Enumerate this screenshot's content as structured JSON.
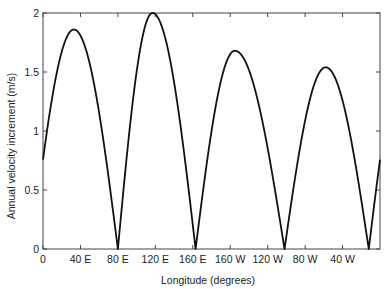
{
  "chart_data": {
    "type": "line",
    "title": "",
    "xlabel": "Longitude (degrees)",
    "ylabel": "Annual velocity increment (m/s)",
    "xlim": [
      0,
      360
    ],
    "ylim": [
      0,
      2
    ],
    "grid": false,
    "legend": null,
    "x_ticks": [
      {
        "value": 0,
        "label": "0"
      },
      {
        "value": 40,
        "label": "40 E"
      },
      {
        "value": 80,
        "label": "80 E"
      },
      {
        "value": 120,
        "label": "120 E"
      },
      {
        "value": 160,
        "label": "160 E"
      },
      {
        "value": 200,
        "label": "160 W"
      },
      {
        "value": 240,
        "label": "120 W"
      },
      {
        "value": 280,
        "label": "80 W"
      },
      {
        "value": 320,
        "label": "40 W"
      }
    ],
    "y_ticks": [
      {
        "value": 0,
        "label": "0"
      },
      {
        "value": 0.5,
        "label": "0.5"
      },
      {
        "value": 1,
        "label": "1"
      },
      {
        "value": 1.5,
        "label": "1.5"
      },
      {
        "value": 2,
        "label": "2"
      }
    ],
    "series": [
      {
        "name": "Annual velocity increment",
        "arches": [
          {
            "start": -12,
            "end": 80,
            "peak_x": 33,
            "peak_y": 1.86
          },
          {
            "start": 80,
            "end": 163,
            "peak_x": 117,
            "peak_y": 2.0
          },
          {
            "start": 163,
            "end": 258,
            "peak_x": 205,
            "peak_y": 1.68
          },
          {
            "start": 258,
            "end": 348,
            "peak_x": 302,
            "peak_y": 1.54
          },
          {
            "start": 348,
            "end": 440,
            "peak_x": 393,
            "peak_y": 1.86
          }
        ],
        "x": [
          0,
          10,
          20,
          33,
          45,
          55,
          65,
          72,
          80,
          90,
          100,
          117,
          130,
          140,
          150,
          157,
          163,
          172,
          185,
          205,
          220,
          232,
          245,
          252,
          258,
          268,
          285,
          302,
          318,
          330,
          340,
          348,
          355,
          360
        ],
        "y": [
          0.68,
          1.35,
          1.7,
          1.86,
          1.7,
          1.35,
          0.9,
          0.5,
          0.0,
          0.85,
          1.55,
          2.0,
          1.75,
          1.35,
          0.85,
          0.45,
          0.0,
          0.75,
          1.4,
          1.68,
          1.45,
          1.05,
          0.5,
          0.25,
          0.0,
          0.75,
          1.35,
          1.54,
          1.3,
          0.9,
          0.45,
          0.0,
          0.45,
          0.72
        ]
      }
    ]
  }
}
